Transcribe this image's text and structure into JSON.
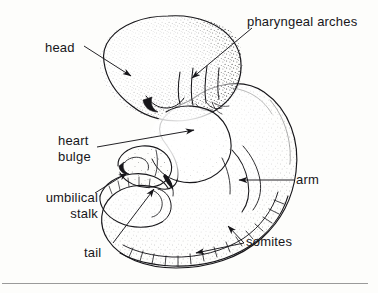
{
  "figure": {
    "kind": "embryo-anatomical-line-drawing",
    "style": "stippled pen-and-ink scientific illustration",
    "background_color": "#fdfdfb",
    "ink_color": "#17161a",
    "stipple_color": "#3a3a3a"
  },
  "labels": {
    "head": "head",
    "pharyngeal_arches": "pharyngeal arches",
    "heart_line1": "heart",
    "heart_line2": "bulge",
    "umbilical_line1": "umbilical",
    "umbilical_line2": "stalk",
    "tail": "tail",
    "arm": "arm",
    "somites": "somites"
  },
  "leaders": {
    "head": "arrow pointing down-right into head lobe",
    "pharyngeal_arches": "diagonal arrow pointing down-left to arches",
    "heart_bulge": "long diagonal arrow pointing up-right to heart bulge",
    "umbilical_stalk": "diagonal arrow pointing up-right to umbilical stalk",
    "tail": "diagonal arrow pointing up-right to tail tip",
    "arm": "horizontal arrow pointing left to arm bud",
    "somites": "forked double arrow pointing left to two somite blocks"
  },
  "rule": {
    "present": true,
    "color": "#9a9a9a"
  }
}
